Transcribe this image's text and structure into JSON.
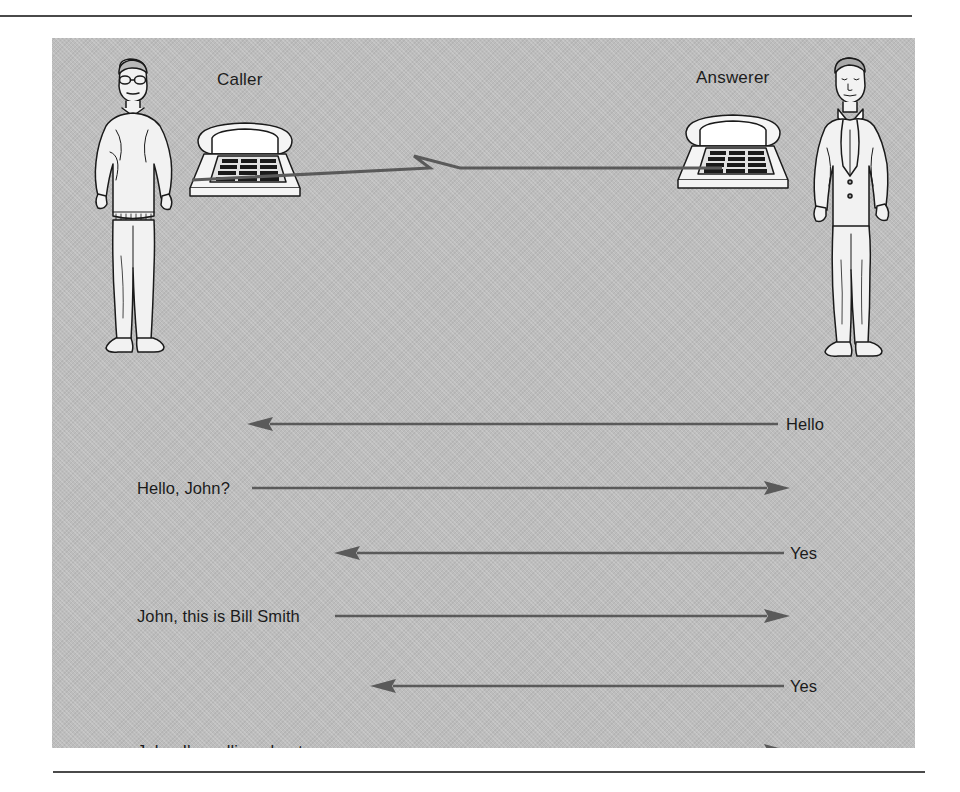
{
  "figure": {
    "panel_background": "#bdbdbd",
    "line_color": "#4a4a4a",
    "text_color": "#1b1b1b"
  },
  "scene": {
    "caller": {
      "role_label": "Caller",
      "person_icon": "standing-man-sweater-glasses-icon",
      "phone_icon": "desk-telephone-icon"
    },
    "answerer": {
      "role_label": "Answerer",
      "person_icon": "standing-man-suit-tie-icon",
      "phone_icon": "desk-telephone-icon"
    },
    "connection_icon": "telephone-wire-icon"
  },
  "dialogue": {
    "rows": [
      {
        "text": "Hello",
        "direction": "right-to-left",
        "speaker": "answerer",
        "label_side": "right",
        "label_x": 734,
        "line_start_x": 195,
        "line_end_x": 726,
        "top": 43
      },
      {
        "text": "Hello, John?",
        "direction": "left-to-right",
        "speaker": "caller",
        "label_side": "left",
        "label_x": 85,
        "line_start_x": 200,
        "line_end_x": 738,
        "top": 107
      },
      {
        "text": "Yes",
        "direction": "right-to-left",
        "speaker": "answerer",
        "label_side": "right",
        "label_x": 738,
        "line_start_x": 282,
        "line_end_x": 732,
        "top": 172
      },
      {
        "text": "John, this is Bill Smith",
        "direction": "left-to-right",
        "speaker": "caller",
        "label_side": "left",
        "label_x": 85,
        "line_start_x": 283,
        "line_end_x": 738,
        "top": 235
      },
      {
        "text": "Yes",
        "direction": "right-to-left",
        "speaker": "answerer",
        "label_side": "right",
        "label_x": 738,
        "line_start_x": 318,
        "line_end_x": 732,
        "top": 305
      },
      {
        "text": "John, I'm calling about . . .",
        "direction": "left-to-right",
        "speaker": "caller",
        "label_side": "left",
        "label_x": 85,
        "line_start_x": 312,
        "line_end_x": 738,
        "top": 370
      }
    ]
  }
}
